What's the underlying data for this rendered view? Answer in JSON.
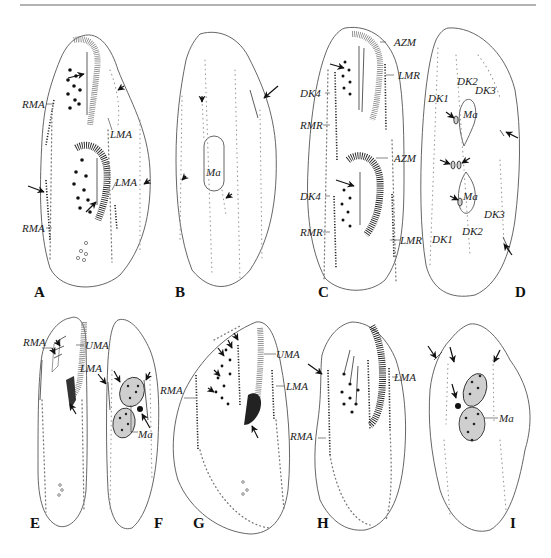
{
  "figure": {
    "panels": [
      {
        "id": "A",
        "label": "A",
        "annotations": [
          "RMA",
          "LMA",
          "LMA",
          "RMA"
        ]
      },
      {
        "id": "B",
        "label": "B",
        "annotations": [
          "Ma"
        ]
      },
      {
        "id": "C",
        "label": "C",
        "annotations": [
          "AZM",
          "LMR",
          "DK4",
          "RMR",
          "AZM",
          "DK4",
          "RMR",
          "LMR"
        ]
      },
      {
        "id": "D",
        "label": "D",
        "annotations": [
          "DK2",
          "DK3",
          "DK1",
          "Ma",
          "Ma",
          "DK3",
          "DK2",
          "DK1"
        ]
      },
      {
        "id": "E",
        "label": "E",
        "annotations": [
          "RMA",
          "UMA"
        ]
      },
      {
        "id": "F",
        "label": "F",
        "annotations": [
          "LMA",
          "Ma"
        ]
      },
      {
        "id": "G",
        "label": "G",
        "annotations": [
          "UMA",
          "RMA",
          "LMA"
        ]
      },
      {
        "id": "H",
        "label": "H",
        "annotations": [
          "LMA",
          "RMA"
        ]
      },
      {
        "id": "I",
        "label": "I",
        "annotations": [
          "Ma"
        ]
      }
    ]
  }
}
